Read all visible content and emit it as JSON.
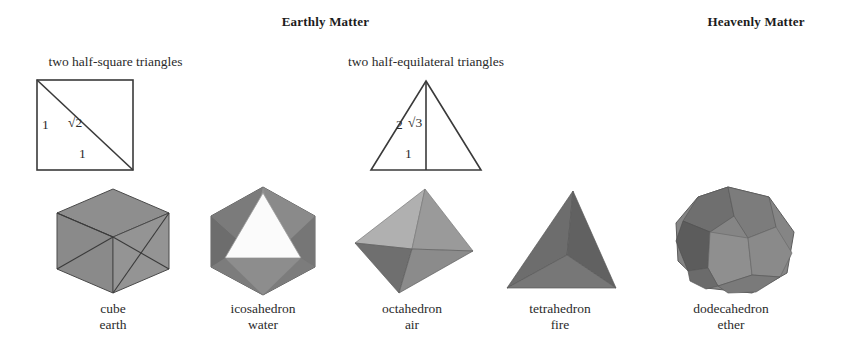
{
  "headings": {
    "earthly": "Earthly Matter",
    "heavenly": "Heavenly Matter"
  },
  "constructions": [
    {
      "id": "half-square",
      "caption": "two half-square triangles",
      "shape": "square-with-diagonal",
      "labels": {
        "left_side": "1",
        "diagonal": "√2",
        "base": "1"
      }
    },
    {
      "id": "half-equilateral",
      "caption": "two half-equilateral triangles",
      "shape": "equilateral-triangle-with-median",
      "labels": {
        "hypotenuse": "2",
        "median": "√3",
        "base": "1"
      }
    }
  ],
  "solids": [
    {
      "name": "cube",
      "element": "earth",
      "group": "earthly",
      "icon": "cube-icon",
      "fill": "#8c8c8c"
    },
    {
      "name": "icosahedron",
      "element": "water",
      "group": "earthly",
      "icon": "icosahedron-icon",
      "fill": "#8f8f8f"
    },
    {
      "name": "octahedron",
      "element": "air",
      "group": "earthly",
      "icon": "octahedron-icon",
      "fill": "#9a9a9a"
    },
    {
      "name": "tetrahedron",
      "element": "fire",
      "group": "earthly",
      "icon": "tetrahedron-icon",
      "fill": "#6e6e6e"
    },
    {
      "name": "dodecahedron",
      "element": "ether",
      "group": "heavenly",
      "icon": "dodecahedron-icon",
      "fill": "#7e7e7e"
    }
  ],
  "colors": {
    "background": "#ffffff",
    "ink": "#2b2b2b",
    "line": "#3a3a3a",
    "gray_light": "#b4b4b4",
    "gray_mid": "#8f8f8f",
    "gray_dark": "#6b6b6b",
    "gray_darker": "#5a5a5a",
    "white_face": "#fdfdfd"
  }
}
